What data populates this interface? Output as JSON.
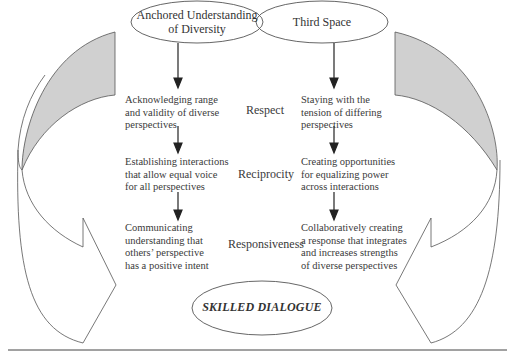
{
  "diagram": {
    "top_ellipses": {
      "left": "Anchored Understanding of Diversity",
      "left_lines": [
        "Anchored Understanding",
        "of Diversity"
      ],
      "right": "Third Space"
    },
    "rows": [
      {
        "label": "Respect",
        "left_lines": [
          "Acknowledging range",
          "and validity of diverse",
          "perspectives"
        ],
        "right_lines": [
          "Staying with the",
          "tension of differing",
          "perspectives"
        ]
      },
      {
        "label": "Reciprocity",
        "left_lines": [
          "Establishing interactions",
          "that allow equal voice",
          "for all perspectives"
        ],
        "right_lines": [
          "Creating opportunities",
          "for equalizing power",
          "across interactions"
        ]
      },
      {
        "label": "Responsiveness",
        "left_lines": [
          "Communicating",
          "understanding that",
          "others’ perspective",
          "has a positive intent"
        ],
        "right_lines": [
          "Collaboratively creating",
          "a response that integrates",
          "and increases strengths",
          "of diverse perspectives"
        ]
      }
    ],
    "bottom_ellipse": "SKILLED DIALOGUE",
    "colors": {
      "stroke": "#555555",
      "arrow_band_fill": "#d0d0d0",
      "text": "#333333",
      "rule": "#444444"
    }
  }
}
